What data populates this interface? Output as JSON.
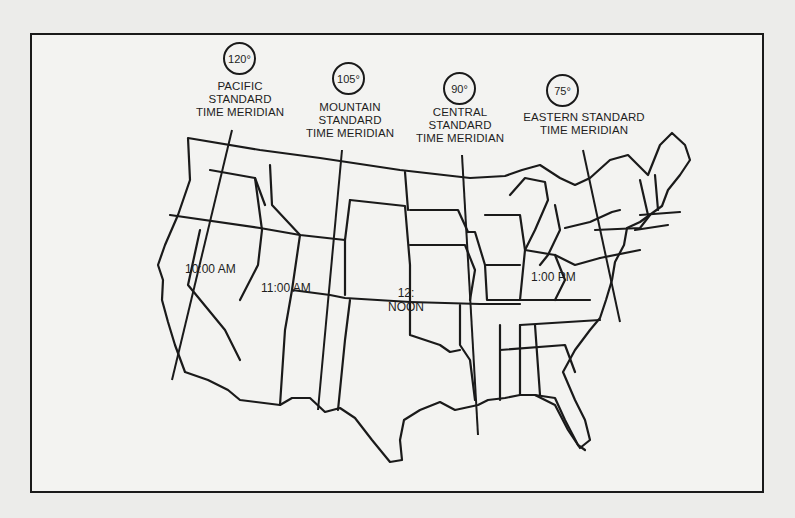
{
  "figure": {
    "meridians": [
      {
        "degree": "120°",
        "line1": "PACIFIC",
        "line2": "STANDARD",
        "line3": "TIME MERIDIAN",
        "time": "10:00 AM"
      },
      {
        "degree": "105°",
        "line1": "MOUNTAIN",
        "line2": "STANDARD",
        "line3": "TIME MERIDIAN",
        "time": "11:00 AM"
      },
      {
        "degree": "90°",
        "line1": "CENTRAL",
        "line2": "STANDARD",
        "line3": "TIME MERIDIAN",
        "time_line1": "12:",
        "time_line2": "NOON"
      },
      {
        "degree": "75°",
        "line1": "EASTERN STANDARD",
        "line2": "TIME MERIDIAN",
        "time": "1:00 PM"
      }
    ]
  },
  "colors": {
    "paper": "#ececea",
    "ink": "#1a1a1a"
  }
}
